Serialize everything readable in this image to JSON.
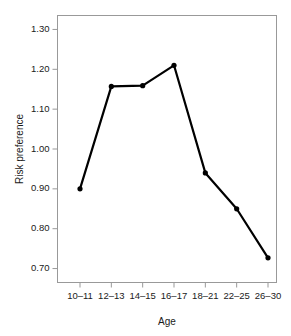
{
  "chart_data": {
    "type": "line",
    "title": "",
    "subtitle": "",
    "xlabel": "Age",
    "ylabel": "Risk preference",
    "categories": [
      "10–11",
      "12–13",
      "14–15",
      "16–17",
      "18–21",
      "22–25",
      "26–30"
    ],
    "values": [
      0.9,
      1.157,
      1.159,
      1.21,
      0.94,
      0.85,
      0.727
    ],
    "series": [
      {
        "name": "Risk preference",
        "values": [
          0.9,
          1.157,
          1.159,
          1.21,
          0.94,
          0.85,
          0.727
        ]
      }
    ],
    "ylim": [
      0.665,
      1.335
    ],
    "yticks": [
      0.7,
      0.8,
      0.9,
      1.0,
      1.1,
      1.2,
      1.3
    ],
    "ytick_labels": [
      "0.70",
      "0.80",
      "0.90",
      "1.00",
      "1.10",
      "1.20",
      "1.30"
    ],
    "xtick_labels": [
      "10–11",
      "12–13",
      "14–15",
      "16–17",
      "18–21",
      "22–25",
      "26–30"
    ],
    "grid": false,
    "legend": false,
    "legend_position": "none",
    "marker": "filled-circle",
    "line_color": "#000000",
    "marker_color": "#000000",
    "frame_color": "#999999",
    "background_color": "#ffffff",
    "annotations": []
  },
  "axes": {
    "y_label": "Risk preference",
    "x_label": "Age"
  }
}
